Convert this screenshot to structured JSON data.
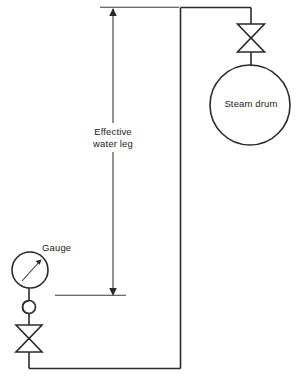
{
  "diagram": {
    "background_color": "#ffffff",
    "line_color": "#2b2b2b",
    "text_color": "#1c1c1c",
    "labels": {
      "steam_drum": "Steam drum",
      "gauge": "Gauge",
      "effective_water_leg": "Effective\nwater leg"
    },
    "components": [
      {
        "name": "steam-drum",
        "type": "vessel-circle",
        "label": "Steam drum",
        "center_x": 250,
        "center_y": 105,
        "radius": 40
      },
      {
        "name": "drum-isolation-valve",
        "type": "gate-valve-bowtie",
        "center_x": 251,
        "center_y": 38,
        "width": 27,
        "height": 28
      },
      {
        "name": "pressure-gauge",
        "type": "gauge-circle-with-needle",
        "label": "Gauge",
        "center_x": 30,
        "center_y": 270,
        "radius": 18,
        "needle_direction": "up-right"
      },
      {
        "name": "siphon-pigtail",
        "type": "loop-seal",
        "center_x": 29,
        "center_y": 307,
        "radius": 6.5
      },
      {
        "name": "gauge-isolation-valve",
        "type": "gate-valve-bowtie",
        "center_x": 29,
        "center_y": 338,
        "width": 26,
        "height": 27
      },
      {
        "name": "connecting-piping",
        "type": "pipe-run",
        "path": "from drum valve left along top to riser, down riser, left along bottom to gauge valve"
      }
    ],
    "dimension": {
      "name": "effective-water-leg",
      "label": "Effective\nwater leg",
      "orientation": "vertical",
      "x": 113,
      "y_top": 8,
      "y_bottom": 296,
      "arrowheads": "both",
      "top_extension_line": {
        "y": 7,
        "x_start": 100,
        "x_end": 179
      },
      "bottom_extension_line": {
        "y": 295,
        "x_start": 55,
        "x_end": 126
      }
    }
  }
}
